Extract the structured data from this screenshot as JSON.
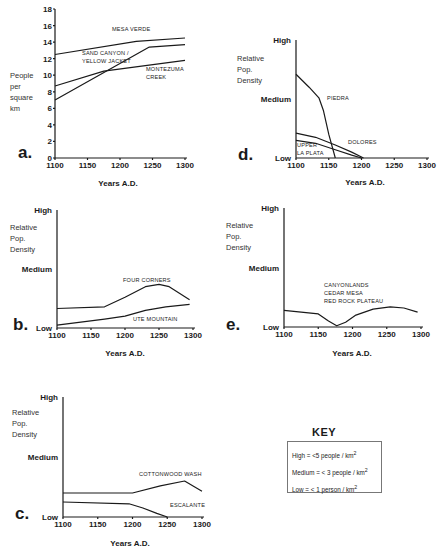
{
  "chart_data": [
    {
      "id": "a",
      "panel_label": "a.",
      "type": "line",
      "title": "",
      "xlabel": "Years A.D.",
      "ylabel": "People per square km",
      "ylabel_lines": [
        "People",
        "per",
        "square",
        "km"
      ],
      "x_ticks": [
        1100,
        1150,
        1200,
        1250,
        1300
      ],
      "y_ticks": [
        0,
        2,
        4,
        6,
        8,
        10,
        12,
        14,
        16,
        18
      ],
      "xlim": [
        1100,
        1300
      ],
      "ylim": [
        0,
        18
      ],
      "grid": false,
      "series": [
        {
          "name": "MESA VERDE",
          "label_lines": [
            "MESA VERDE"
          ],
          "x": [
            1100,
            1225,
            1300
          ],
          "y": [
            12.5,
            14.1,
            14.5
          ]
        },
        {
          "name": "SAND CANYON / YELLOW JACKET",
          "label_lines": [
            "SAND CANYON /",
            "YELLOW JACKET"
          ],
          "x": [
            1100,
            1245,
            1300
          ],
          "y": [
            7.0,
            13.4,
            13.7
          ]
        },
        {
          "name": "MONTEZUMA CREEK",
          "label_lines": [
            "MONTEZUMA",
            "CREEK"
          ],
          "x": [
            1100,
            1175,
            1300
          ],
          "y": [
            8.7,
            10.5,
            11.8
          ]
        }
      ]
    },
    {
      "id": "d",
      "panel_label": "d.",
      "type": "line",
      "title": "",
      "xlabel": "Years A.D.",
      "ylabel": "Relative Pop. Density",
      "ylabel_lines": [
        "Relative",
        "Pop.",
        "Density"
      ],
      "x_ticks": [
        1100,
        1150,
        1200,
        1250,
        1300
      ],
      "y_levels": [
        "Low",
        "Medium",
        "High"
      ],
      "xlim": [
        1100,
        1300
      ],
      "ylim": [
        0,
        2
      ],
      "grid": false,
      "series": [
        {
          "name": "PIEDRA",
          "label_lines": [
            "PIEDRA"
          ],
          "x": [
            1100,
            1120,
            1135,
            1142,
            1150,
            1160
          ],
          "y": [
            1.42,
            1.2,
            1.02,
            0.8,
            0.4,
            0
          ]
        },
        {
          "name": "DOLORES",
          "label_lines": [
            "DOLORES"
          ],
          "x": [
            1100,
            1130,
            1160,
            1185,
            1203
          ],
          "y": [
            0.42,
            0.35,
            0.22,
            0.1,
            0
          ]
        },
        {
          "name": "UPPER LA PLATA",
          "label_lines": [
            "UPPER",
            "LA PLATA"
          ],
          "x": [
            1100,
            1130,
            1160,
            1185,
            1200
          ],
          "y": [
            0.3,
            0.25,
            0.14,
            0.05,
            0
          ]
        }
      ]
    },
    {
      "id": "b",
      "panel_label": "b.",
      "type": "line",
      "title": "",
      "xlabel": "Years A.D.",
      "ylabel": "Relative Pop. Density",
      "ylabel_lines": [
        "Relative",
        "Pop.",
        "Density"
      ],
      "x_ticks": [
        1100,
        1150,
        1200,
        1250,
        1300
      ],
      "y_levels": [
        "Low",
        "Medium",
        "High"
      ],
      "xlim": [
        1100,
        1300
      ],
      "ylim": [
        0,
        2
      ],
      "grid": false,
      "series": [
        {
          "name": "FOUR CORNERS",
          "label_lines": [
            "FOUR CORNERS"
          ],
          "x": [
            1100,
            1170,
            1200,
            1230,
            1250,
            1265,
            1295
          ],
          "y": [
            0.33,
            0.36,
            0.52,
            0.7,
            0.74,
            0.7,
            0.48
          ]
        },
        {
          "name": "UTE MOUNTAIN",
          "label_lines": [
            "UTE MOUNTAIN"
          ],
          "x": [
            1100,
            1170,
            1200,
            1230,
            1260,
            1295
          ],
          "y": [
            0.05,
            0.15,
            0.2,
            0.3,
            0.36,
            0.4
          ]
        }
      ]
    },
    {
      "id": "e",
      "panel_label": "e.",
      "type": "line",
      "title": "",
      "xlabel": "Years A.D.",
      "ylabel": "Relative Pop. Density",
      "ylabel_lines": [
        "Relative",
        "Pop.",
        "Density"
      ],
      "x_ticks": [
        1100,
        1150,
        1200,
        1250,
        1300
      ],
      "y_levels": [
        "Low",
        "Medium",
        "High"
      ],
      "xlim": [
        1100,
        1300
      ],
      "ylim": [
        0,
        2
      ],
      "grid": false,
      "series": [
        {
          "name": "CANYONLANDS / CEDAR MESA / RED ROCK PLATEAU",
          "label_lines": [
            "CANYONLANDS",
            "CEDAR MESA",
            "RED ROCK PLATEAU"
          ],
          "x": [
            1100,
            1150,
            1165,
            1177,
            1190,
            1205,
            1230,
            1255,
            1275,
            1295
          ],
          "y": [
            0.28,
            0.22,
            0.1,
            0.02,
            0.08,
            0.2,
            0.3,
            0.34,
            0.32,
            0.25
          ]
        }
      ]
    },
    {
      "id": "c",
      "panel_label": "c.",
      "type": "line",
      "title": "",
      "xlabel": "Years A.D.",
      "ylabel": "Relative Pop. Density",
      "ylabel_lines": [
        "Relative",
        "Pop.",
        "Density"
      ],
      "x_ticks": [
        1100,
        1150,
        1200,
        1250,
        1300
      ],
      "y_levels": [
        "Low",
        "Medium",
        "High"
      ],
      "xlim": [
        1100,
        1300
      ],
      "ylim": [
        0,
        2
      ],
      "grid": false,
      "series": [
        {
          "name": "COTTONWOOD WASH",
          "label_lines": [
            "COTTONWOOD  WASH"
          ],
          "x": [
            1100,
            1200,
            1240,
            1275,
            1300
          ],
          "y": [
            0.4,
            0.4,
            0.52,
            0.6,
            0.43
          ]
        },
        {
          "name": "ESCALANTE",
          "label_lines": [
            "ESCALANTE"
          ],
          "x": [
            1100,
            1195,
            1215,
            1235,
            1250
          ],
          "y": [
            0.25,
            0.22,
            0.15,
            0.06,
            0
          ]
        }
      ]
    }
  ],
  "key": {
    "title": "KEY",
    "rows": [
      {
        "label": "High",
        "text": "High = <5  people / km",
        "sup": "2"
      },
      {
        "label": "Medium",
        "text": "Medium =  < 3  people / km",
        "sup": "2"
      },
      {
        "label": "Low",
        "text": "Low =  < 1 person / km",
        "sup": "2"
      }
    ]
  }
}
